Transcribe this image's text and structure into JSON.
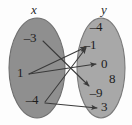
{
  "diagram": {
    "type": "mapping-diagram",
    "domain_label": "x",
    "range_label": "y",
    "domain_set": {
      "name": "x",
      "fill": "#8f8f8f",
      "stroke": "#6e6e6e",
      "members": [
        {
          "value": "–3",
          "x": 30,
          "y": 37
        },
        {
          "value": "1",
          "x": 20,
          "y": 72
        },
        {
          "value": "–4",
          "x": 32,
          "y": 99
        }
      ]
    },
    "range_set": {
      "name": "y",
      "fill": "#a8a8a8",
      "stroke": "#7a7a7a",
      "members": [
        {
          "value": "–4",
          "x": 96,
          "y": 26
        },
        {
          "value": "–1",
          "x": 90,
          "y": 44
        },
        {
          "value": "0",
          "x": 104,
          "y": 63
        },
        {
          "value": "8",
          "x": 112,
          "y": 78
        },
        {
          "value": "–9",
          "x": 96,
          "y": 92
        },
        {
          "value": "3",
          "x": 104,
          "y": 106
        }
      ]
    },
    "arrows": [
      {
        "from": "–3",
        "to": "–9",
        "head": "down-right"
      },
      {
        "from": "1",
        "to": "–1",
        "head": "up-right"
      },
      {
        "from": "1",
        "to": "0",
        "head": "right"
      },
      {
        "from": "–4",
        "to": "–1",
        "head": "up-right"
      },
      {
        "from": "–4",
        "to": "3",
        "head": "right"
      }
    ],
    "colors": {
      "background": "#fdfdfd",
      "line": "#3a3a3a",
      "text": "#1d1d1d"
    }
  }
}
